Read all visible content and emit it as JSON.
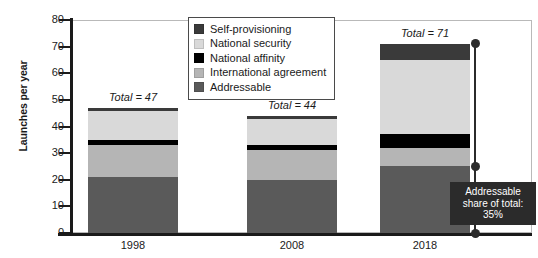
{
  "chart_data": {
    "type": "bar",
    "title": "",
    "subtitle": "",
    "xlabel": "",
    "ylabel": "Launches per year",
    "ylim": [
      0,
      80
    ],
    "ytick_values": [
      0,
      10,
      20,
      30,
      40,
      50,
      60,
      70,
      80
    ],
    "ytick_labels": [
      "0",
      "10",
      "20",
      "30",
      "40",
      "50",
      "60",
      "70",
      "80"
    ],
    "grid": false,
    "stacked": true,
    "legend_position": "top-center-inside",
    "categories": [
      "1998",
      "2008",
      "2018"
    ],
    "series": [
      {
        "name": "Addressable",
        "color": "#5a5a5a",
        "values": [
          21,
          20,
          25
        ]
      },
      {
        "name": "International agreement",
        "color": "#b5b5b5",
        "values": [
          12,
          11,
          7
        ]
      },
      {
        "name": "National affinity",
        "color": "#000000",
        "values": [
          2,
          2,
          5
        ]
      },
      {
        "name": "National security",
        "color": "#d9d9d9",
        "values": [
          11,
          10,
          28
        ]
      },
      {
        "name": "Self-provisioning",
        "color": "#3a3a3a",
        "values": [
          1,
          1,
          6
        ]
      }
    ],
    "stack_order_bottom_to_top": [
      "Addressable",
      "International agreement",
      "National affinity",
      "National security",
      "Self-provisioning"
    ],
    "legend_order_top_to_bottom": [
      "Self-provisioning",
      "National security",
      "National affinity",
      "International agreement",
      "Addressable"
    ],
    "bar_totals": [
      47,
      44,
      71
    ],
    "annotations": [
      {
        "name": "total-1998",
        "text": "Total = 47"
      },
      {
        "name": "total-2008",
        "text": "Total = 44"
      },
      {
        "name": "total-2018",
        "text": "Total = 71"
      },
      {
        "name": "callout",
        "text_lines": [
          "Addressable",
          "share of total:",
          "35%"
        ],
        "value": "35%"
      }
    ]
  },
  "legend": {
    "items": [
      {
        "label": "Self-provisioning",
        "color": "#3a3a3a"
      },
      {
        "label": "National security",
        "color": "#d9d9d9"
      },
      {
        "label": "National affinity",
        "color": "#000000"
      },
      {
        "label": "International agreement",
        "color": "#b5b5b5"
      },
      {
        "label": "Addressable",
        "color": "#5a5a5a"
      }
    ]
  },
  "axes": {
    "y_title": "Launches per year",
    "y_ticks": [
      "80",
      "70",
      "60",
      "50",
      "40",
      "30",
      "20",
      "10",
      "0"
    ],
    "x_ticks": [
      "1998",
      "2008",
      "2018"
    ]
  },
  "totals": {
    "bar_1998": "Total = 47",
    "bar_2008": "Total = 44",
    "bar_2018": "Total = 71"
  },
  "callout": {
    "line1": "Addressable",
    "line2": "share of total:",
    "line3": "35%"
  },
  "colors": {
    "self_provisioning": "#3a3a3a",
    "national_security": "#d9d9d9",
    "national_affinity": "#000000",
    "international_agreement": "#b5b5b5",
    "addressable": "#5a5a5a",
    "axis": "#1a1a1a",
    "frame": "#b9b9b9",
    "callout_bg": "#2b2b2b",
    "callout_text": "#ffffff"
  }
}
